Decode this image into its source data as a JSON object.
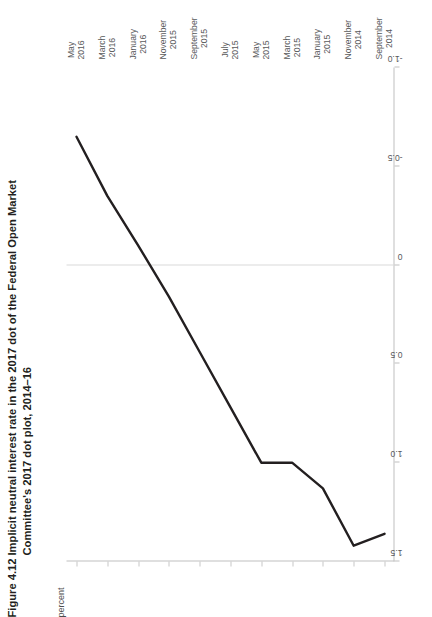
{
  "figure": {
    "number": "Figure 4.12",
    "title": "Implicit neutral interest rate in the 2017 dot of the Federal Open Market Committee's 2017 dot plot, 2014–16",
    "unit_label": "percent"
  },
  "chart_data": {
    "type": "line",
    "title": "Implicit neutral interest rate in the 2017 dot of the Federal Open Market Committee's 2017 dot plot, 2014–16",
    "orientation": "rotated-90-ccw",
    "xlabel": "",
    "ylabel": "percent",
    "ylim": [
      -1.0,
      1.5
    ],
    "ytick_labels": [
      "1.5",
      "1.0",
      "0.5",
      "0",
      "-0.5",
      "-1.0"
    ],
    "ytick_values": [
      1.5,
      1.0,
      0.5,
      0,
      -0.5,
      -1.0
    ],
    "grid": "zero-line-only",
    "legend": "none",
    "categories": [
      "September\n2014",
      "November\n2014",
      "January\n2015",
      "March\n2015",
      "May\n2015",
      "July\n2015",
      "September\n2015",
      "November\n2015",
      "January\n2016",
      "March\n2016",
      "May\n2016"
    ],
    "xtick_labels": [
      [
        "September",
        "2014"
      ],
      [
        "November",
        "2014"
      ],
      [
        "January",
        "2015"
      ],
      [
        "March",
        "2015"
      ],
      [
        "May",
        "2015"
      ],
      [
        "July",
        "2015"
      ],
      [
        "September",
        "2015"
      ],
      [
        "November",
        "2015"
      ],
      [
        "January",
        "2016"
      ],
      [
        "March",
        "2016"
      ],
      [
        "May",
        "2016"
      ]
    ],
    "series": [
      {
        "name": "Implicit neutral interest rate",
        "color": "#231f20",
        "values": [
          1.36,
          1.42,
          1.13,
          1.0,
          1.0,
          0.72,
          0.44,
          0.16,
          -0.1,
          -0.35,
          -0.65
        ]
      }
    ]
  }
}
